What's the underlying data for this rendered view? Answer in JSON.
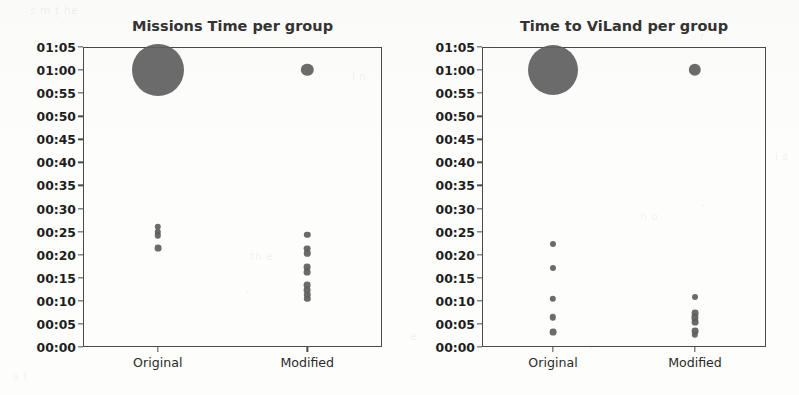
{
  "figure": {
    "width": 799,
    "height": 395,
    "background": "#fdfdfc",
    "marker_color": "#5e5e5e",
    "axis_color": "#4a4a4a"
  },
  "ghost_artifacts": [
    {
      "text": "s m  t he",
      "x": 30,
      "y": 4
    },
    {
      "text": "i n",
      "x": 352,
      "y": 70
    },
    {
      "text": "r",
      "x": 700,
      "y": 30
    },
    {
      "text": "th e",
      "x": 250,
      "y": 250
    },
    {
      "text": "s",
      "x": 60,
      "y": 300
    },
    {
      "text": "n o",
      "x": 640,
      "y": 210
    },
    {
      "text": "e",
      "x": 410,
      "y": 330
    },
    {
      "text": "i s",
      "x": 775,
      "y": 150
    },
    {
      "text": "a  t",
      "x": 12,
      "y": 370
    }
  ],
  "chart_data": [
    {
      "type": "scatter",
      "panel_id": "missions-time",
      "title": "Missions Time per group",
      "xlabel": "",
      "ylabel": "",
      "categories": [
        "Original",
        "Modified"
      ],
      "ytick_labels": [
        "00:00",
        "00:05",
        "00:10",
        "00:15",
        "00:20",
        "00:25",
        "00:30",
        "00:35",
        "00:40",
        "00:45",
        "00:50",
        "00:55",
        "01:00",
        "01:05"
      ],
      "ytick_values": [
        0,
        5,
        10,
        15,
        20,
        25,
        30,
        35,
        40,
        45,
        50,
        55,
        60,
        65
      ],
      "ylim": [
        0,
        65
      ],
      "grid": false,
      "legend": "none",
      "series": [
        {
          "name": "Original",
          "x_category": "Original",
          "points": [
            {
              "y_label": "01:00",
              "y_value": 60.0,
              "size": 26.0,
              "count": "large"
            },
            {
              "y_label": "00:26",
              "y_value": 26.1,
              "size": 3.2,
              "count": "1"
            },
            {
              "y_label": "00:25",
              "y_value": 25.0,
              "size": 3.2,
              "count": "1"
            },
            {
              "y_label": "00:24",
              "y_value": 24.2,
              "size": 3.2,
              "count": "1"
            },
            {
              "y_label": "00:21",
              "y_value": 21.4,
              "size": 3.4,
              "count": "1"
            }
          ]
        },
        {
          "name": "Modified",
          "x_category": "Modified",
          "points": [
            {
              "y_label": "01:00",
              "y_value": 60.0,
              "size": 6.2,
              "count": "medium"
            },
            {
              "y_label": "00:24",
              "y_value": 24.3,
              "size": 3.2,
              "count": "1"
            },
            {
              "y_label": "00:21",
              "y_value": 21.3,
              "size": 3.4,
              "count": "1"
            },
            {
              "y_label": "00:20",
              "y_value": 20.3,
              "size": 3.2,
              "count": "1"
            },
            {
              "y_label": "00:17",
              "y_value": 17.3,
              "size": 3.4,
              "count": "1"
            },
            {
              "y_label": "00:16",
              "y_value": 16.3,
              "size": 3.4,
              "count": "1"
            },
            {
              "y_label": "00:13",
              "y_value": 13.4,
              "size": 3.4,
              "count": "1"
            },
            {
              "y_label": "00:12",
              "y_value": 12.4,
              "size": 3.4,
              "count": "1"
            },
            {
              "y_label": "00:11",
              "y_value": 11.3,
              "size": 3.2,
              "count": "1"
            },
            {
              "y_label": "00:10",
              "y_value": 10.4,
              "size": 3.2,
              "count": "1"
            }
          ]
        }
      ]
    },
    {
      "type": "scatter",
      "panel_id": "time-to-viland",
      "title": "Time to ViLand per group",
      "xlabel": "",
      "ylabel": "",
      "categories": [
        "Original",
        "Modified"
      ],
      "ytick_labels": [
        "00:00",
        "00:05",
        "00:10",
        "00:15",
        "00:20",
        "00:25",
        "00:30",
        "00:35",
        "00:40",
        "00:45",
        "00:50",
        "00:55",
        "01:00",
        "01:05"
      ],
      "ytick_values": [
        0,
        5,
        10,
        15,
        20,
        25,
        30,
        35,
        40,
        45,
        50,
        55,
        60,
        65
      ],
      "ylim": [
        0,
        65
      ],
      "grid": false,
      "legend": "none",
      "series": [
        {
          "name": "Original",
          "x_category": "Original",
          "points": [
            {
              "y_label": "01:00",
              "y_value": 60.0,
              "size": 25.0,
              "count": "large"
            },
            {
              "y_label": "00:22",
              "y_value": 22.3,
              "size": 3.0,
              "count": "1"
            },
            {
              "y_label": "00:17",
              "y_value": 17.2,
              "size": 3.0,
              "count": "1"
            },
            {
              "y_label": "00:10",
              "y_value": 10.4,
              "size": 3.2,
              "count": "1"
            },
            {
              "y_label": "00:06",
              "y_value": 6.4,
              "size": 3.2,
              "count": "1"
            },
            {
              "y_label": "00:03",
              "y_value": 3.2,
              "size": 3.4,
              "count": "1"
            }
          ]
        },
        {
          "name": "Modified",
          "x_category": "Modified",
          "points": [
            {
              "y_label": "01:00",
              "y_value": 60.0,
              "size": 6.2,
              "count": "medium"
            },
            {
              "y_label": "00:11",
              "y_value": 10.9,
              "size": 3.0,
              "count": "1"
            },
            {
              "y_label": "00:07",
              "y_value": 7.4,
              "size": 3.4,
              "count": "1"
            },
            {
              "y_label": "00:06",
              "y_value": 6.4,
              "size": 3.6,
              "count": "1"
            },
            {
              "y_label": "00:05",
              "y_value": 5.4,
              "size": 3.4,
              "count": "1"
            },
            {
              "y_label": "00:03",
              "y_value": 3.4,
              "size": 3.4,
              "count": "1"
            },
            {
              "y_label": "00:02",
              "y_value": 2.6,
              "size": 3.2,
              "count": "1"
            }
          ]
        }
      ]
    }
  ],
  "panels": [
    {
      "id": "missions-time",
      "box": {
        "left": 83,
        "top": 47,
        "width": 299,
        "height": 300
      },
      "title_top": 18,
      "title_left": 83,
      "title_width": 299
    },
    {
      "id": "time-to-viland",
      "box": {
        "left": 482,
        "top": 47,
        "width": 284,
        "height": 300
      },
      "title_top": 18,
      "title_left": 482,
      "title_width": 284
    }
  ]
}
